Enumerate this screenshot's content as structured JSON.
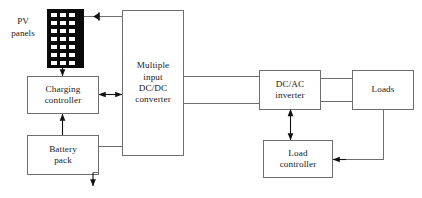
{
  "diagram": {
    "stroke_color": "#6e6e6e",
    "arrow_color": "#111111",
    "panel_fill": "#0a0a0a",
    "panel_cell_color": "#ffffff",
    "background": "#ffffff",
    "blocks": [
      {
        "id": "pv-panels",
        "label": "PV\npanels",
        "x": 2,
        "y": 14,
        "w": 42,
        "h": 34,
        "boxed": false
      },
      {
        "id": "pv-array",
        "label": "",
        "x": 47,
        "y": 9,
        "w": 37,
        "h": 59,
        "boxed": false
      },
      {
        "id": "charging-controller",
        "label": "Charging\ncontroller",
        "x": 27,
        "y": 76,
        "w": 72,
        "h": 38,
        "boxed": true
      },
      {
        "id": "battery-pack",
        "label": "Battery\npack",
        "x": 27,
        "y": 135,
        "w": 72,
        "h": 40,
        "boxed": true
      },
      {
        "id": "dcdc-converter",
        "label": "Multiple\ninput\nDC/DC\nconverter",
        "x": 122,
        "y": 10,
        "w": 62,
        "h": 146,
        "boxed": true
      },
      {
        "id": "dcac-inverter",
        "label": "DC/AC\ninverter",
        "x": 259,
        "y": 70,
        "w": 62,
        "h": 40,
        "boxed": true
      },
      {
        "id": "loads",
        "label": "Loads",
        "x": 352,
        "y": 70,
        "w": 62,
        "h": 40,
        "boxed": true
      },
      {
        "id": "load-controller",
        "label": "Load\ncontroller",
        "x": 263,
        "y": 140,
        "w": 70,
        "h": 38,
        "boxed": true
      }
    ],
    "pv_array": {
      "columns": 3,
      "rows": 7
    },
    "connections": [
      {
        "id": "pv-to-converter",
        "from": "pv-array",
        "to": "dcdc-converter",
        "kind": "diode-line"
      },
      {
        "id": "pv-ground-output",
        "from": "pv-array",
        "to": "ground",
        "kind": "arrow-down"
      },
      {
        "id": "pv-to-charging-controller",
        "from": "pv-array",
        "to": "charging-controller",
        "kind": "arrow-down"
      },
      {
        "id": "charging-to-converter",
        "from": "charging-controller",
        "to": "dcdc-converter",
        "kind": "double-arrow"
      },
      {
        "id": "battery-to-charging",
        "from": "battery-pack",
        "to": "charging-controller",
        "kind": "arrow-up"
      },
      {
        "id": "battery-to-converter",
        "from": "battery-pack",
        "to": "dcdc-converter",
        "kind": "line"
      },
      {
        "id": "battery-ground-output",
        "from": "battery-pack",
        "to": "ground",
        "kind": "arrow-down"
      },
      {
        "id": "converter-to-inverter",
        "from": "dcdc-converter",
        "to": "dcac-inverter",
        "kind": "double-line"
      },
      {
        "id": "inverter-to-loads",
        "from": "dcac-inverter",
        "to": "loads",
        "kind": "double-line"
      },
      {
        "id": "inverter-to-load-controller",
        "from": "dcac-inverter",
        "to": "load-controller",
        "kind": "double-arrow-vertical"
      },
      {
        "id": "loads-to-load-controller",
        "from": "loads",
        "to": "load-controller",
        "kind": "arrow-left"
      }
    ]
  }
}
